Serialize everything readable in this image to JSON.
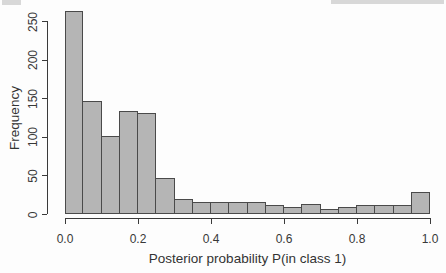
{
  "chart_data": {
    "type": "bar",
    "subtype": "histogram",
    "title": "",
    "xlabel": "Posterior probability P(in class 1)",
    "ylabel": "Frequency",
    "bin_start": 0.0,
    "bin_width": 0.05,
    "values": [
      263,
      146,
      101,
      134,
      131,
      47,
      20,
      16,
      15,
      16,
      16,
      12,
      9,
      13,
      6,
      9,
      12,
      12,
      12,
      28
    ],
    "x_tick_values": [
      0.0,
      0.2,
      0.4,
      0.6,
      0.8,
      1.0
    ],
    "x_tick_labels": [
      "0.0",
      "0.2",
      "0.4",
      "0.6",
      "0.8",
      "1.0"
    ],
    "y_tick_values": [
      0,
      50,
      100,
      150,
      200,
      250
    ],
    "y_tick_labels": [
      "0",
      "50",
      "100",
      "150",
      "200",
      "250"
    ],
    "xlim": [
      0.0,
      1.0
    ],
    "ylim": [
      0,
      250
    ],
    "grid": false,
    "legend": null,
    "colors": {
      "bar_fill": "#b5b5b5",
      "bar_border": "#4a4a4a",
      "axis": "#3a3a3a",
      "text": "#383838",
      "background": "#fdfdfd"
    }
  }
}
